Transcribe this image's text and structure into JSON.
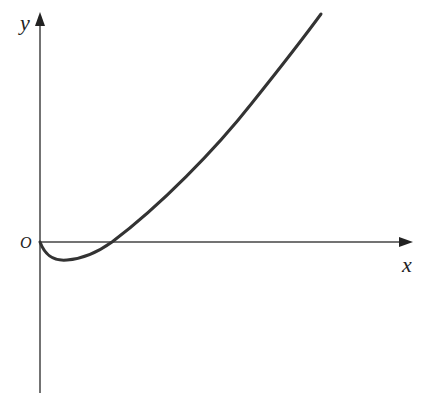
{
  "diagram": {
    "type": "function-graph",
    "axes": {
      "x_label": "x",
      "y_label": "y",
      "origin_label": "O"
    },
    "curve": {
      "description": "Curve starting at origin, dipping below x-axis to a minimum, crossing the x-axis, then rising steeply to the upper right",
      "features": [
        "passes through origin",
        "local minimum below x-axis",
        "x-intercept right of origin",
        "increasing, concave up"
      ]
    },
    "colors": {
      "stroke": "#333333",
      "background": "#ffffff"
    }
  }
}
